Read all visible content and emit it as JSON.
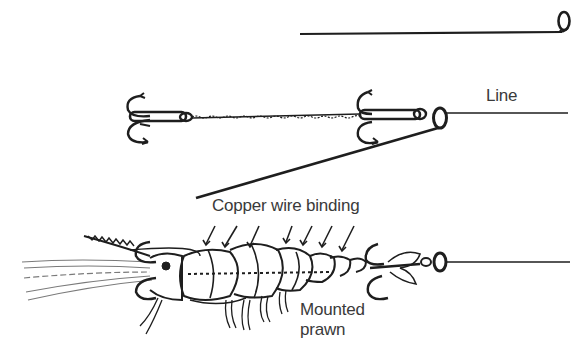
{
  "diagram": {
    "labels": {
      "line": "Line",
      "binding": "Copper wire binding",
      "prawn_line1": "Mounted",
      "prawn_line2": "prawn"
    },
    "stages": [
      {
        "name": "baiting-needle",
        "description": "Needle with eye at right end"
      },
      {
        "name": "trace-assembly",
        "description": "Two treble hooks joined by twisted wire trace, needle threaded to line"
      },
      {
        "name": "mounted-prawn",
        "description": "Prawn on trace bound with copper wire, trebles at head and tail"
      }
    ],
    "colors": {
      "ink": "#1e1e1e",
      "text": "#3a3a3a",
      "background": "#ffffff"
    }
  }
}
